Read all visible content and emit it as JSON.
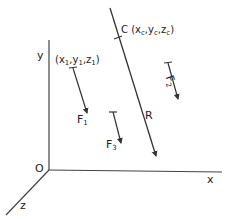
{
  "diagram": {
    "type": "3d-force-system",
    "axes": {
      "x_label": "x",
      "y_label": "y",
      "z_label": "z",
      "origin_label": "O"
    },
    "forces": [
      {
        "name": "F",
        "sub": "1",
        "point_label": {
          "open": "(x",
          "s1": "1",
          "m1": ",y",
          "s2": "1",
          "m2": ",z",
          "s3": "1",
          "close": ")"
        }
      },
      {
        "name": "F",
        "sub": "2"
      },
      {
        "name": "F",
        "sub": "3"
      }
    ],
    "resultant": {
      "name": "R",
      "point_name": "C",
      "point_label": {
        "open": "(x",
        "s1": "c",
        "m1": ",y",
        "s2": "c",
        "m2": ",z",
        "s3": "c",
        "close": ")"
      }
    },
    "colors": {
      "line": "#333333",
      "text": "#222222",
      "background": "#ffffff"
    }
  }
}
